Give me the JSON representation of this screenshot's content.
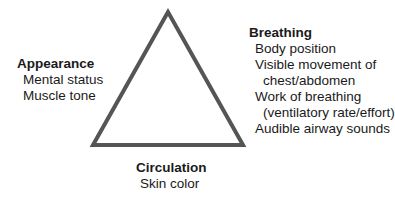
{
  "triangle": {
    "stroke_color": "#555555"
  },
  "appearance": {
    "title": "Appearance",
    "items": [
      "Mental status",
      "Muscle tone"
    ]
  },
  "breathing": {
    "title": "Breathing",
    "items": [
      "Body position",
      "Visible movement of",
      "chest/abdomen",
      "Work of breathing",
      "(ventilatory rate/effort)",
      "Audible airway sounds"
    ]
  },
  "circulation": {
    "title": "Circulation",
    "items": [
      "Skin color"
    ]
  }
}
